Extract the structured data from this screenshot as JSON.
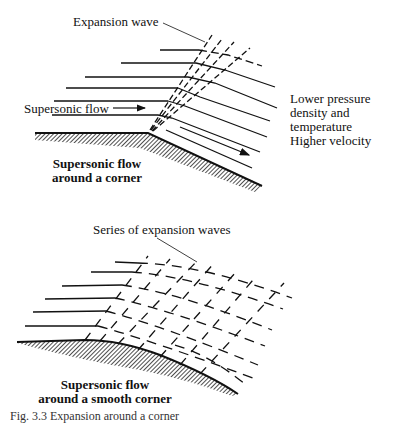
{
  "top_diagram": {
    "wave_label": "Expansion wave",
    "flow_label": "Supersonic flow",
    "result_lines": [
      "Lower pressure",
      "density and",
      "temperature",
      "Higher velocity"
    ],
    "title_lines": [
      "Supersonic flow",
      "around a corner"
    ]
  },
  "bottom_diagram": {
    "wave_label": "Series of expansion waves",
    "title_lines": [
      "Supersonic flow",
      "around a smooth corner"
    ]
  },
  "caption": "Fig. 3.3  Expansion around a corner"
}
